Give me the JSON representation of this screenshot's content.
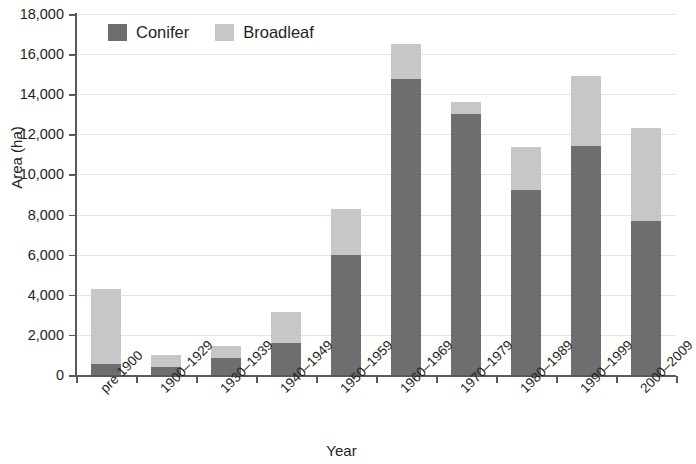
{
  "chart_data": {
    "type": "bar",
    "subtype": "stacked-vertical",
    "title": "",
    "xlabel": "Year",
    "ylabel": "Area (ha)",
    "ylim": [
      0,
      18000
    ],
    "ytick_step": 2000,
    "ytick_labels": [
      "18,000",
      "16,000",
      "14,000",
      "12,000",
      "10,000",
      "8,000",
      "6,000",
      "4,000",
      "2,000",
      "0"
    ],
    "ytick_values": [
      18000,
      16000,
      14000,
      12000,
      10000,
      8000,
      6000,
      4000,
      2000,
      0
    ],
    "grid": true,
    "grid_axis": "y",
    "legend_position": "top-left-inside",
    "categories": [
      "pre 1900",
      "1900–1929",
      "1930–1939",
      "1940–1949",
      "1950–1959",
      "1960–1969",
      "1970–1979",
      "1980–1989",
      "1990–1999",
      "2000–2009"
    ],
    "series": [
      {
        "name": "Conifer",
        "color": "#6d6e70",
        "values": [
          550,
          400,
          850,
          1600,
          6000,
          14750,
          13000,
          9200,
          11400,
          7700
        ]
      },
      {
        "name": "Broadleaf",
        "color": "#c6c7c8",
        "values": [
          3750,
          600,
          600,
          1550,
          2300,
          1750,
          600,
          2150,
          3500,
          4600
        ]
      }
    ],
    "totals": [
      4300,
      1000,
      1450,
      3150,
      8300,
      16500,
      13600,
      11350,
      14900,
      12300
    ]
  },
  "legend": {
    "items": [
      {
        "label": "Conifer",
        "swatch": "conifer-swatch"
      },
      {
        "label": "Broadleaf",
        "swatch": "broadleaf-swatch"
      }
    ]
  },
  "axes": {
    "y_title": "Area (ha)",
    "x_title": "Year"
  },
  "colors": {
    "conifer": "#6d6e70",
    "broadleaf": "#c6c7c8",
    "axis": "#58595b",
    "grid": "#e3e3e3",
    "text": "#231f20",
    "background": "#ffffff"
  }
}
